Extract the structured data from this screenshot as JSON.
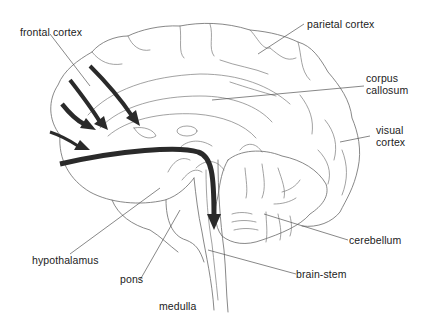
{
  "figure": {
    "type": "sagittal brain section diagram",
    "labels": {
      "frontal_cortex": "frontal cortex",
      "parietal_cortex": "parietal cortex",
      "corpus_callosum_line1": "corpus",
      "corpus_callosum_line2": "callosum",
      "visual_cortex_line1": "visual",
      "visual_cortex_line2": "cortex",
      "cerebellum": "cerebellum",
      "brain_stem": "brain-stem",
      "hypothalamus": "hypothalamus",
      "pons": "pons",
      "medulla": "medulla"
    },
    "arrows": {
      "count": 5,
      "color": "#2a2a2a",
      "description": "pathways from frontal cortex converging toward the brain-stem"
    },
    "colors": {
      "line": "#6a6a6a",
      "arrow": "#2a2a2a",
      "text": "#222222",
      "background": "#ffffff"
    }
  }
}
